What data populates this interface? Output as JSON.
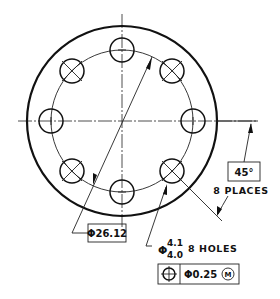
{
  "drawing": {
    "type": "bolt-hole-circle-flange",
    "outer_circle": {
      "cx": 122,
      "cy": 121,
      "r": 95
    },
    "bolt_circle": {
      "cx": 122,
      "cy": 121,
      "r": 71
    },
    "hole_radius": 12,
    "hole_count": 8,
    "hole_angle_step_deg": 45
  },
  "annotations": {
    "bolt_circle_dimension": {
      "symbol": "Φ",
      "value": "26.12",
      "label": "Φ26.12"
    },
    "angle_dimension": {
      "value": "45°",
      "note": "8 PLACES"
    },
    "hole_callout": {
      "symbol": "Φ",
      "upper_limit": "4.1",
      "lower_limit": "4.0",
      "note": "8 HOLES"
    },
    "feature_control_frame": {
      "characteristic": "position",
      "characteristic_icon": "position-icon",
      "tolerance": "Φ0.25",
      "modifier": "M",
      "modifier_meaning": "maximum material condition"
    }
  },
  "colors": {
    "line": "#111111",
    "background": "#ffffff"
  }
}
